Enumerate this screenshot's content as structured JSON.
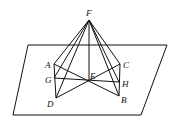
{
  "diagram": {
    "type": "geometry-figure",
    "labels": {
      "F": "F",
      "A": "A",
      "C": "C",
      "E": "E",
      "G": "G",
      "H": "H",
      "D": "D",
      "B": "B"
    },
    "points": {
      "F": [
        89,
        20
      ],
      "A": [
        54,
        64
      ],
      "C": [
        120,
        64
      ],
      "E": [
        89,
        81
      ],
      "G": [
        54,
        78
      ],
      "H": [
        119,
        82
      ],
      "D": [
        56,
        98
      ],
      "B": [
        119,
        96
      ]
    },
    "plane": [
      [
        28,
        45
      ],
      [
        167,
        45
      ],
      [
        141,
        115
      ],
      [
        13,
        115
      ]
    ],
    "segments": [
      [
        "F",
        "A"
      ],
      [
        "F",
        "G"
      ],
      [
        "F",
        "D"
      ],
      [
        "F",
        "E"
      ],
      [
        "F",
        "C"
      ],
      [
        "F",
        "H"
      ],
      [
        "F",
        "B"
      ],
      [
        "A",
        "D"
      ],
      [
        "C",
        "B"
      ],
      [
        "A",
        "B"
      ],
      [
        "C",
        "D"
      ],
      [
        "G",
        "H"
      ]
    ]
  }
}
